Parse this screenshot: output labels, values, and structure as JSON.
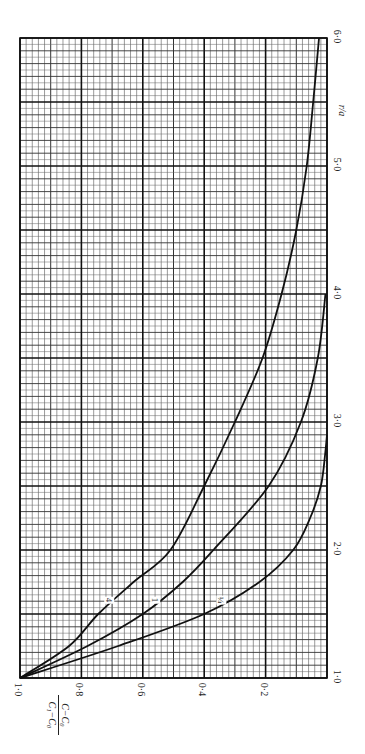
{
  "chart_data": {
    "type": "line",
    "orientation": "rotated-90-clockwise",
    "title": "",
    "xlabel": "r/a",
    "ylabel": "(C − C₀)/(C₁ − C₀)",
    "ylabel_num": "C−C₀",
    "ylabel_den": "C₁−C₀",
    "xlim": [
      1.0,
      6.0
    ],
    "ylim": [
      0.0,
      1.0
    ],
    "x_ticks": [
      "1·0",
      "2·0",
      "3·0",
      "4·0",
      "5·0",
      "6·0"
    ],
    "y_ticks": [
      "1·0",
      "0·8",
      "0·6",
      "0·4",
      "0·2"
    ],
    "grid": true,
    "legend": "inline curve labels",
    "series": [
      {
        "name": "4",
        "label": "4",
        "x": [
          1.0,
          1.25,
          1.5,
          1.75,
          2.0,
          2.5,
          3.0,
          3.5,
          4.0,
          4.5,
          5.0,
          5.5,
          6.0
        ],
        "y": [
          1.0,
          0.84,
          0.745,
          0.63,
          0.51,
          0.4,
          0.3,
          0.21,
          0.148,
          0.1,
          0.066,
          0.045,
          0.026
        ]
      },
      {
        "name": "1",
        "label": "1",
        "x": [
          1.0,
          1.25,
          1.5,
          1.75,
          2.0,
          2.5,
          3.0,
          3.5,
          4.0
        ],
        "y": [
          1.0,
          0.78,
          0.6,
          0.47,
          0.37,
          0.19,
          0.085,
          0.03,
          0.005
        ]
      },
      {
        "name": "1/4",
        "label": "¼",
        "x": [
          1.0,
          1.25,
          1.5,
          1.75,
          2.0,
          2.25,
          2.5,
          2.75,
          2.9
        ],
        "y": [
          1.0,
          0.68,
          0.4,
          0.22,
          0.11,
          0.055,
          0.02,
          0.006,
          0.0
        ]
      }
    ]
  },
  "labels": {
    "x_axis_title": "r/a",
    "curve_labels": [
      "4",
      "1",
      "¼"
    ]
  }
}
